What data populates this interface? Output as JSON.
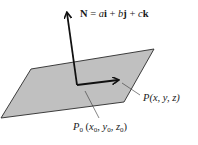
{
  "diagram": {
    "type": "plane-with-normal-vector",
    "colors": {
      "plane_fill": "#c0c0c0",
      "plane_stroke": "#2a2a2a",
      "arrow_stroke": "#111111",
      "leader_stroke": "#333333",
      "background": "#ffffff"
    },
    "normal_vector": {
      "symbol": "N",
      "equals": " = ",
      "a": "a",
      "i": "i",
      "plus1": " + ",
      "b": "b",
      "j": "j",
      "plus2": " + ",
      "c": "c",
      "k": "k"
    },
    "point_p": {
      "name": "P",
      "coords": "(x, y, z)"
    },
    "point_p0": {
      "name": "P",
      "subscript": "0",
      "open": " (",
      "x": "x",
      "x_sub": "0",
      "sep1": ", ",
      "y": "y",
      "y_sub": "0",
      "sep2": ", ",
      "z": "z",
      "z_sub": "0",
      "close": ")"
    }
  }
}
